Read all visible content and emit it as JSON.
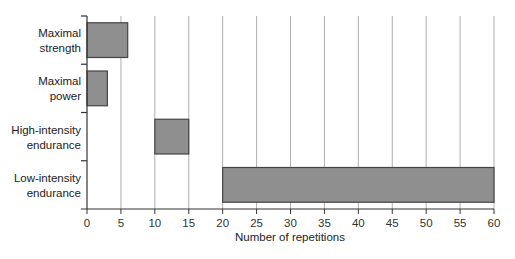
{
  "chart_data": {
    "type": "bar",
    "orientation": "horizontal",
    "subtype": "floating-range",
    "title": "",
    "xlabel": "Number of repetitions",
    "ylabel": "",
    "xlim": [
      0,
      60
    ],
    "xticks": [
      0,
      5,
      10,
      15,
      20,
      25,
      30,
      35,
      40,
      45,
      50,
      55,
      60
    ],
    "grid": "vertical",
    "legend": null,
    "categories": [
      "Maximal strength",
      "Maximal power",
      "High-intensity endurance",
      "Low-intensity endurance"
    ],
    "category_lines": [
      [
        "Maximal",
        "strength"
      ],
      [
        "Maximal",
        "power"
      ],
      [
        "High-intensity",
        "endurance"
      ],
      [
        "Low-intensity",
        "endurance"
      ]
    ],
    "series": [
      {
        "name": "Repetition range",
        "ranges": [
          [
            0,
            6
          ],
          [
            0,
            3
          ],
          [
            10,
            15
          ],
          [
            20,
            60
          ]
        ]
      }
    ],
    "colors": {
      "bar_fill": "#8f8f8f",
      "bar_stroke": "#444444",
      "grid": "#b0b0b0",
      "axis": "#333333"
    }
  }
}
